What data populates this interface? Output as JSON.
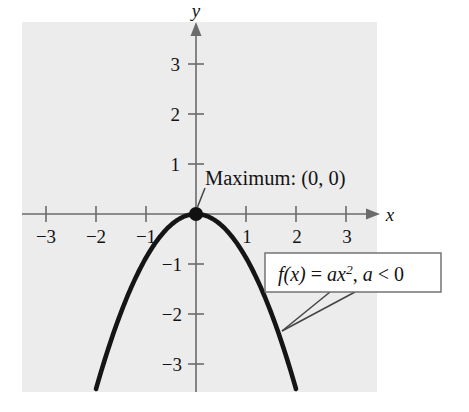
{
  "figure": {
    "kind": "coordinate-plane-graph",
    "background_color": "#ffffff",
    "panel_color": "#ececec",
    "curve_color": "#151515",
    "axis_color": "#6b6b6b"
  },
  "axes": {
    "x_name": "x",
    "y_name": "y",
    "x_ticks": [
      {
        "value": -3,
        "label": "−3"
      },
      {
        "value": -2,
        "label": "−2"
      },
      {
        "value": -1,
        "label": "−1"
      },
      {
        "value": 1,
        "label": "1"
      },
      {
        "value": 2,
        "label": "2"
      },
      {
        "value": 3,
        "label": "3"
      }
    ],
    "y_ticks": [
      {
        "value": 3,
        "label": "3"
      },
      {
        "value": 2,
        "label": "2"
      },
      {
        "value": 1,
        "label": "1"
      },
      {
        "value": -1,
        "label": "−1"
      },
      {
        "value": -2,
        "label": "−2"
      },
      {
        "value": -3,
        "label": "−3"
      }
    ]
  },
  "annotations": {
    "vertex_label": "Maximum: (0, 0)",
    "formula_fx": "f",
    "formula_arg": "(x)",
    "formula_eq": " = ",
    "formula_a": "a",
    "formula_x": "x",
    "formula_exp": "2",
    "formula_tail": ", ",
    "formula_a2": "a",
    "formula_lt": " < 0",
    "formula_plain": "f(x) = ax², a < 0"
  },
  "chart_data": {
    "type": "line",
    "title": "",
    "xlabel": "x",
    "ylabel": "y",
    "xlim": [
      -3.6,
      3.6
    ],
    "ylim": [
      -3.7,
      3.6
    ],
    "grid": false,
    "legend": "none",
    "function": "f(x) = a*x^2, a < 0",
    "coefficient_a": -0.875,
    "vertex": [
      0,
      0
    ],
    "vertex_type": "maximum",
    "x": [
      -2.0,
      -1.75,
      -1.5,
      -1.25,
      -1.0,
      -0.75,
      -0.5,
      -0.25,
      0,
      0.25,
      0.5,
      0.75,
      1.0,
      1.25,
      1.5,
      1.75,
      2.0
    ],
    "y": [
      -3.5,
      -2.68,
      -1.97,
      -1.37,
      -0.88,
      -0.49,
      -0.22,
      -0.05,
      0,
      -0.05,
      -0.22,
      -0.49,
      -0.88,
      -1.37,
      -1.97,
      -2.68,
      -3.5
    ],
    "annotations": [
      {
        "text": "Maximum: (0, 0)",
        "point": [
          0,
          0
        ]
      },
      {
        "text": "f(x) = ax², a < 0",
        "point": [
          1.7,
          -2.3
        ]
      }
    ]
  }
}
